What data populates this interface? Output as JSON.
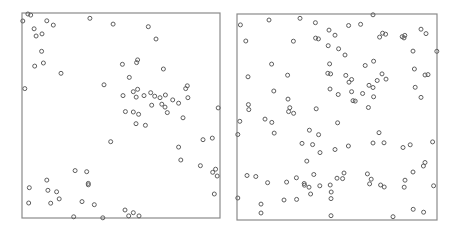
{
  "chart_data": [
    {
      "type": "scatter",
      "title": "",
      "xlabel": "",
      "ylabel": "",
      "xlim": [
        0,
        1
      ],
      "ylim": [
        0,
        1
      ],
      "grid": false,
      "legend": null,
      "marker": "open-circle",
      "marker_color": "#5e5e5e",
      "frame_color": "#8a8a8a",
      "description": "Clustered point pattern",
      "points": [
        [
          0.004,
          0.961
        ],
        [
          0.03,
          0.995
        ],
        [
          0.044,
          0.99
        ],
        [
          0.061,
          0.923
        ],
        [
          0.071,
          0.888
        ],
        [
          0.101,
          0.898
        ],
        [
          0.125,
          0.962
        ],
        [
          0.158,
          0.941
        ],
        [
          0.099,
          0.813
        ],
        [
          0.064,
          0.741
        ],
        [
          0.108,
          0.756
        ],
        [
          0.197,
          0.706
        ],
        [
          0.014,
          0.631
        ],
        [
          0.343,
          0.974
        ],
        [
          0.46,
          0.946
        ],
        [
          0.414,
          0.65
        ],
        [
          0.638,
          0.933
        ],
        [
          0.677,
          0.873
        ],
        [
          0.507,
          0.75
        ],
        [
          0.579,
          0.758
        ],
        [
          0.584,
          0.771
        ],
        [
          0.714,
          0.727
        ],
        [
          0.542,
          0.686
        ],
        [
          0.51,
          0.597
        ],
        [
          0.562,
          0.616
        ],
        [
          0.584,
          0.628
        ],
        [
          0.577,
          0.59
        ],
        [
          0.616,
          0.597
        ],
        [
          0.65,
          0.611
        ],
        [
          0.67,
          0.594
        ],
        [
          0.697,
          0.587
        ],
        [
          0.724,
          0.6
        ],
        [
          0.761,
          0.576
        ],
        [
          0.791,
          0.56
        ],
        [
          0.827,
          0.631
        ],
        [
          0.835,
          0.645
        ],
        [
          0.838,
          0.587
        ],
        [
          0.655,
          0.55
        ],
        [
          0.706,
          0.555
        ],
        [
          0.722,
          0.541
        ],
        [
          0.734,
          0.514
        ],
        [
          0.522,
          0.519
        ],
        [
          0.562,
          0.517
        ],
        [
          0.589,
          0.506
        ],
        [
          0.576,
          0.46
        ],
        [
          0.623,
          0.452
        ],
        [
          0.813,
          0.489
        ],
        [
          0.991,
          0.537
        ],
        [
          0.448,
          0.372
        ],
        [
          0.791,
          0.346
        ],
        [
          0.914,
          0.382
        ],
        [
          0.961,
          0.39
        ],
        [
          0.802,
          0.283
        ],
        [
          0.901,
          0.255
        ],
        [
          0.963,
          0.223
        ],
        [
          0.978,
          0.238
        ],
        [
          0.986,
          0.205
        ],
        [
          0.971,
          0.117
        ],
        [
          0.52,
          0.039
        ],
        [
          0.562,
          0.026
        ],
        [
          0.539,
          0.01
        ],
        [
          0.591,
          0.01
        ],
        [
          0.408,
          0.001
        ],
        [
          0.268,
          0.231
        ],
        [
          0.327,
          0.226
        ],
        [
          0.125,
          0.185
        ],
        [
          0.335,
          0.169
        ],
        [
          0.335,
          0.162
        ],
        [
          0.037,
          0.148
        ],
        [
          0.131,
          0.135
        ],
        [
          0.175,
          0.128
        ],
        [
          0.188,
          0.093
        ],
        [
          0.034,
          0.073
        ],
        [
          0.145,
          0.072
        ],
        [
          0.303,
          0.08
        ],
        [
          0.365,
          0.065
        ],
        [
          0.261,
          0.006
        ]
      ]
    },
    {
      "type": "scatter",
      "title": "",
      "xlabel": "",
      "ylabel": "",
      "xlim": [
        0,
        1
      ],
      "ylim": [
        0,
        1
      ],
      "grid": false,
      "legend": null,
      "marker": "open-circle",
      "marker_color": "#5e5e5e",
      "frame_color": "#8a8a8a",
      "description": "Regular / random point pattern",
      "points": [
        [
          0.017,
          0.947
        ],
        [
          0.16,
          0.971
        ],
        [
          0.315,
          0.979
        ],
        [
          0.392,
          0.958
        ],
        [
          0.282,
          0.868
        ],
        [
          0.393,
          0.883
        ],
        [
          0.46,
          0.922
        ],
        [
          0.49,
          0.897
        ],
        [
          0.558,
          0.944
        ],
        [
          0.618,
          0.95
        ],
        [
          0.68,
          0.996
        ],
        [
          0.92,
          0.926
        ],
        [
          0.839,
          0.896
        ],
        [
          0.945,
          0.905
        ],
        [
          0.999,
          0.819
        ],
        [
          0.407,
          0.879
        ],
        [
          0.508,
          0.831
        ],
        [
          0.456,
          0.846
        ],
        [
          0.54,
          0.801
        ],
        [
          0.713,
          0.888
        ],
        [
          0.728,
          0.907
        ],
        [
          0.743,
          0.902
        ],
        [
          0.826,
          0.89
        ],
        [
          0.835,
          0.884
        ],
        [
          0.544,
          0.702
        ],
        [
          0.88,
          0.82
        ],
        [
          0.044,
          0.869
        ],
        [
          0.173,
          0.757
        ],
        [
          0.253,
          0.703
        ],
        [
          0.454,
          0.712
        ],
        [
          0.463,
          0.758
        ],
        [
          0.468,
          0.709
        ],
        [
          0.725,
          0.709
        ],
        [
          0.56,
          0.669
        ],
        [
          0.573,
          0.682
        ],
        [
          0.641,
          0.75
        ],
        [
          0.683,
          0.771
        ],
        [
          0.745,
          0.684
        ],
        [
          0.573,
          0.623
        ],
        [
          0.66,
          0.654
        ],
        [
          0.701,
          0.677
        ],
        [
          0.887,
          0.733
        ],
        [
          0.94,
          0.704
        ],
        [
          0.92,
          0.595
        ],
        [
          0.955,
          0.706
        ],
        [
          0.891,
          0.644
        ],
        [
          0.68,
          0.643
        ],
        [
          0.628,
          0.614
        ],
        [
          0.055,
          0.695
        ],
        [
          0.184,
          0.626
        ],
        [
          0.255,
          0.587
        ],
        [
          0.057,
          0.56
        ],
        [
          0.465,
          0.636
        ],
        [
          0.506,
          0.609
        ],
        [
          0.683,
          0.598
        ],
        [
          0.591,
          0.577
        ],
        [
          0.657,
          0.546
        ],
        [
          0.58,
          0.579
        ],
        [
          0.059,
          0.536
        ],
        [
          0.264,
          0.545
        ],
        [
          0.258,
          0.526
        ],
        [
          0.283,
          0.518
        ],
        [
          0.014,
          0.479
        ],
        [
          0.396,
          0.54
        ],
        [
          0.174,
          0.474
        ],
        [
          0.14,
          0.49
        ],
        [
          0.004,
          0.415
        ],
        [
          0.186,
          0.422
        ],
        [
          0.362,
          0.436
        ],
        [
          0.408,
          0.414
        ],
        [
          0.503,
          0.472
        ],
        [
          0.325,
          0.372
        ],
        [
          0.378,
          0.366
        ],
        [
          0.49,
          0.342
        ],
        [
          0.349,
          0.286
        ],
        [
          0.415,
          0.327
        ],
        [
          0.557,
          0.359
        ],
        [
          0.68,
          0.374
        ],
        [
          0.71,
          0.424
        ],
        [
          0.735,
          0.375
        ],
        [
          0.83,
          0.352
        ],
        [
          0.866,
          0.365
        ],
        [
          0.978,
          0.379
        ],
        [
          0.94,
          0.279
        ],
        [
          0.05,
          0.216
        ],
        [
          0.094,
          0.211
        ],
        [
          0.153,
          0.181
        ],
        [
          0.248,
          0.184
        ],
        [
          0.297,
          0.205
        ],
        [
          0.336,
          0.177
        ],
        [
          0.298,
          0.1
        ],
        [
          0.36,
          0.159
        ],
        [
          0.337,
          0.169
        ],
        [
          0.414,
          0.166
        ],
        [
          0.384,
          0.221
        ],
        [
          0.5,
          0.203
        ],
        [
          0.528,
          0.201
        ],
        [
          0.652,
          0.224
        ],
        [
          0.671,
          0.198
        ],
        [
          0.736,
          0.16
        ],
        [
          0.84,
          0.193
        ],
        [
          0.88,
          0.233
        ],
        [
          0.983,
          0.166
        ],
        [
          0.932,
          0.262
        ],
        [
          0.466,
          0.17
        ],
        [
          0.471,
          0.136
        ],
        [
          0.368,
          0.126
        ],
        [
          0.47,
          0.104
        ],
        [
          0.004,
          0.107
        ],
        [
          0.235,
          0.097
        ],
        [
          0.12,
          0.077
        ],
        [
          0.12,
          0.034
        ],
        [
          0.47,
          0.021
        ],
        [
          0.78,
          0.016
        ],
        [
          0.933,
          0.038
        ],
        [
          0.881,
          0.052
        ],
        [
          0.836,
          0.159
        ],
        [
          0.718,
          0.17
        ],
        [
          0.663,
          0.175
        ],
        [
          0.535,
          0.228
        ]
      ]
    }
  ],
  "panels": [
    {
      "name": "left-panel",
      "frame": {
        "x": 22,
        "y": 13,
        "w": 198,
        "h": 205
      }
    },
    {
      "name": "right-panel",
      "frame": {
        "x": 237,
        "y": 14,
        "w": 200,
        "h": 206
      }
    }
  ]
}
